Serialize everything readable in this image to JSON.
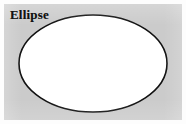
{
  "figure": {
    "kind": "geometric-shape-diagram",
    "label": "Ellipse",
    "background_color": "#cbcbcb",
    "page_color": "#fdfdfd",
    "shape": {
      "name": "ellipse",
      "fill_color": "#ffffff",
      "stroke_color": "#111111",
      "stroke_width": 1.6,
      "center_x": 93,
      "center_y": 63,
      "radius_x": 74,
      "radius_y": 48.5
    }
  }
}
